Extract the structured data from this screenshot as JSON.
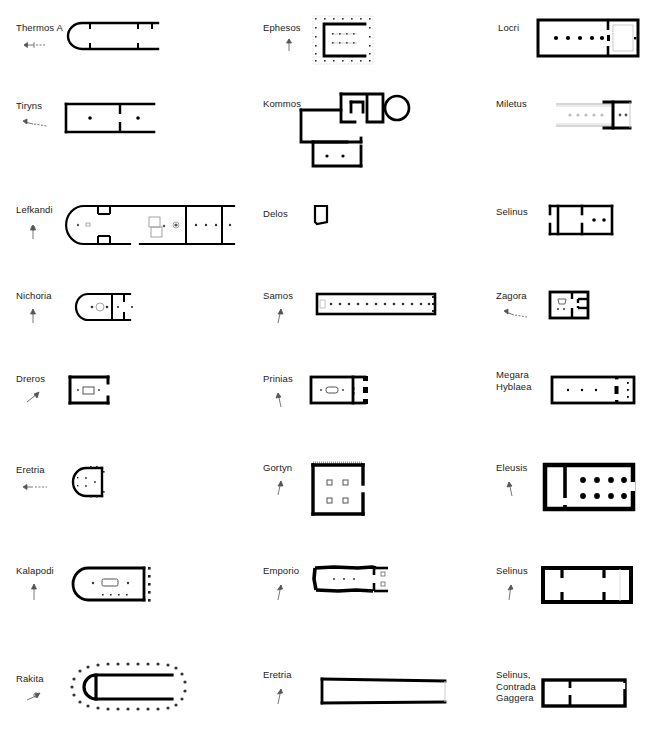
{
  "figure": {
    "type": "architectural-plan-grid",
    "columns": 3,
    "rows": 8,
    "background_color": "#ffffff",
    "line_color": "#000000",
    "label_color": "#222222"
  },
  "plans": [
    {
      "id": "thermos-a",
      "label": "Thermos A",
      "column": 1,
      "row": 1,
      "shape": "apsidal-hall",
      "has_scale_icon": true,
      "notes": "Long apsidal building, open east end, two cross walls"
    },
    {
      "id": "ephesos",
      "label": "Ephesos",
      "column": 2,
      "row": 1,
      "shape": "rectangular-u-open-east",
      "has_scale_icon": true,
      "notes": "Peripteral dotted column ring around solid U-shaped cella, two interior column rows"
    },
    {
      "id": "locri",
      "label": "Locri",
      "column": 3,
      "row": 1,
      "shape": "rectangular-with-adyton",
      "has_scale_icon": false,
      "notes": "Long rectangular cella with axial column row of 5, rear adyton chamber"
    },
    {
      "id": "tiryns",
      "label": "Tiryns",
      "column": 1,
      "row": 2,
      "shape": "rectangular-two-room",
      "has_scale_icon": true,
      "notes": "Rectangular hall divided into two rooms, one central base in each"
    },
    {
      "id": "kommos",
      "label": "Kommos",
      "column": 2,
      "row": 2,
      "shape": "irregular-complex",
      "has_scale_icon": false,
      "notes": "Irregular multi-room complex with circular structure at upper right"
    },
    {
      "id": "miletus",
      "label": "Miletus",
      "column": 3,
      "row": 2,
      "shape": "partial-rectangular",
      "has_scale_icon": false,
      "notes": "Faint long hall (reconstructed outline) with heavy cross wall near east end"
    },
    {
      "id": "lefkandi",
      "label": "Lefkandi",
      "column": 1,
      "row": 3,
      "shape": "long-apsidal-house",
      "has_scale_icon": true,
      "notes": "Very long apsidal building, apse at west, several cross walls, grave shafts in centre"
    },
    {
      "id": "delos",
      "label": "Delos",
      "column": 2,
      "row": 3,
      "shape": "small-square-room",
      "has_scale_icon": false,
      "notes": "Very small single room"
    },
    {
      "id": "selinus-r3",
      "label": "Selinus",
      "column": 3,
      "row": 3,
      "shape": "rectangular-with-porch",
      "has_scale_icon": false,
      "notes": "Rectangular building with narrow western porch and inner room with two bases"
    },
    {
      "id": "nichoria",
      "label": "Nichoria",
      "column": 1,
      "row": 4,
      "shape": "apsidal-two-room",
      "has_scale_icon": true,
      "notes": "Apsidal house, apse west, circular hearth, rear rooms"
    },
    {
      "id": "samos",
      "label": "Samos",
      "column": 2,
      "row": 4,
      "shape": "long-narrow-hall",
      "has_scale_icon": true,
      "notes": "Hekatompedon: very long narrow hall with axial row of ~13 column bases"
    },
    {
      "id": "zagora",
      "label": "Zagora",
      "column": 3,
      "row": 4,
      "shape": "square-two-room",
      "has_scale_icon": true,
      "notes": "Small square building, bench/altar in main room, annexe to east"
    },
    {
      "id": "dreros",
      "label": "Dreros",
      "column": 1,
      "row": 5,
      "shape": "rectangular-single-room",
      "has_scale_icon": true,
      "notes": "Small rectangle with central hearth box, open east side"
    },
    {
      "id": "prinias",
      "label": "Prinias",
      "column": 2,
      "row": 5,
      "shape": "rectangular-with-pillars",
      "has_scale_icon": true,
      "notes": "Rectangular cella with central hearth, east porch with pillar blocks"
    },
    {
      "id": "megara-hyblaea",
      "label": "Megara\nHyblaea",
      "column": 3,
      "row": 5,
      "shape": "long-rectangular-axial",
      "has_scale_icon": false,
      "notes": "Long rectangle with axial bases and east cross wall"
    },
    {
      "id": "eretria-r6",
      "label": "Eretria",
      "column": 1,
      "row": 6,
      "shape": "apsidal-small",
      "has_scale_icon": true,
      "notes": "Small apsidal building, apse west, post holes around perimeter"
    },
    {
      "id": "gortyn",
      "label": "Gortyn",
      "column": 2,
      "row": 6,
      "shape": "square-four-pillar",
      "has_scale_icon": true,
      "notes": "Near-square room with four interior pillar bases, open east side"
    },
    {
      "id": "eleusis",
      "label": "Eleusis",
      "column": 3,
      "row": 6,
      "shape": "rectangular-with-columns",
      "has_scale_icon": true,
      "notes": "Rectangular hall with eight interior columns (4 x 2) and western annexe"
    },
    {
      "id": "kalapodi",
      "label": "Kalapodi",
      "column": 1,
      "row": 7,
      "shape": "apsidal-with-east-columns",
      "has_scale_icon": true,
      "notes": "Apsidal hall, apse west, central rectangular hearth, east column row"
    },
    {
      "id": "emporio",
      "label": "Emporio",
      "column": 2,
      "row": 7,
      "shape": "irregular-rectangular",
      "has_scale_icon": true,
      "notes": "Rubble-walled elongated room with axial bases and east porch"
    },
    {
      "id": "selinus-r7",
      "label": "Selinus",
      "column": 3,
      "row": 7,
      "shape": "rectangular-three-room",
      "has_scale_icon": true,
      "notes": "Rectangular temple divided into pronaos, cella and adyton"
    },
    {
      "id": "rakita",
      "label": "Rakita",
      "column": 1,
      "row": 8,
      "shape": "apsidal-peripteral",
      "has_scale_icon": true,
      "notes": "Apsidal building surrounded by a dotted ring of exterior post/column positions"
    },
    {
      "id": "eretria-r8",
      "label": "Eretria",
      "column": 2,
      "row": 8,
      "shape": "long-narrow-hall",
      "has_scale_icon": true,
      "notes": "Long narrow rectangular hall, slightly tapering"
    },
    {
      "id": "selinus-contrada-gaggera",
      "label": "Selinus,\nContrada\nGaggera",
      "column": 3,
      "row": 8,
      "shape": "rectangular-two-room",
      "has_scale_icon": false,
      "notes": "Rectangular building with short cross wall creating a western room"
    }
  ]
}
